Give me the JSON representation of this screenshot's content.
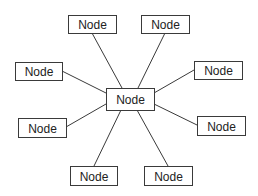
{
  "diagram": {
    "type": "hub-and-spoke",
    "center": {
      "id": "center",
      "label": "Node",
      "x": 106,
      "y": 88,
      "w": 48,
      "h": 22
    },
    "nodes": [
      {
        "id": "top-left",
        "label": "Node",
        "x": 68,
        "y": 15,
        "w": 48,
        "h": 18
      },
      {
        "id": "top-right",
        "label": "Node",
        "x": 141,
        "y": 15,
        "w": 48,
        "h": 18
      },
      {
        "id": "left",
        "label": "Node",
        "x": 15,
        "y": 62,
        "w": 47,
        "h": 18
      },
      {
        "id": "right",
        "label": "Node",
        "x": 194,
        "y": 61,
        "w": 48,
        "h": 18
      },
      {
        "id": "lower-left",
        "label": "Node",
        "x": 18,
        "y": 118,
        "w": 48,
        "h": 19
      },
      {
        "id": "lower-right",
        "label": "Node",
        "x": 197,
        "y": 116,
        "w": 48,
        "h": 19
      },
      {
        "id": "bottom-left",
        "label": "Node",
        "x": 70,
        "y": 166,
        "w": 47,
        "h": 19
      },
      {
        "id": "bottom-right",
        "label": "Node",
        "x": 144,
        "y": 166,
        "w": 48,
        "h": 19
      }
    ],
    "edges": [
      {
        "from": "center",
        "to": "top-left",
        "x1": 122,
        "y1": 88,
        "x2": 92,
        "y2": 33
      },
      {
        "from": "center",
        "to": "top-right",
        "x1": 138,
        "y1": 88,
        "x2": 165,
        "y2": 33
      },
      {
        "from": "center",
        "to": "left",
        "x1": 106,
        "y1": 93,
        "x2": 62,
        "y2": 71
      },
      {
        "from": "center",
        "to": "right",
        "x1": 154,
        "y1": 93,
        "x2": 194,
        "y2": 70
      },
      {
        "from": "center",
        "to": "lower-left",
        "x1": 106,
        "y1": 104,
        "x2": 66,
        "y2": 127
      },
      {
        "from": "center",
        "to": "lower-right",
        "x1": 154,
        "y1": 104,
        "x2": 197,
        "y2": 125
      },
      {
        "from": "center",
        "to": "bottom-left",
        "x1": 121,
        "y1": 110,
        "x2": 94,
        "y2": 166
      },
      {
        "from": "center",
        "to": "bottom-right",
        "x1": 137,
        "y1": 110,
        "x2": 168,
        "y2": 166
      }
    ],
    "colors": {
      "stroke": "#3a3a3a",
      "fill": "#ffffff",
      "text": "#222222"
    }
  }
}
